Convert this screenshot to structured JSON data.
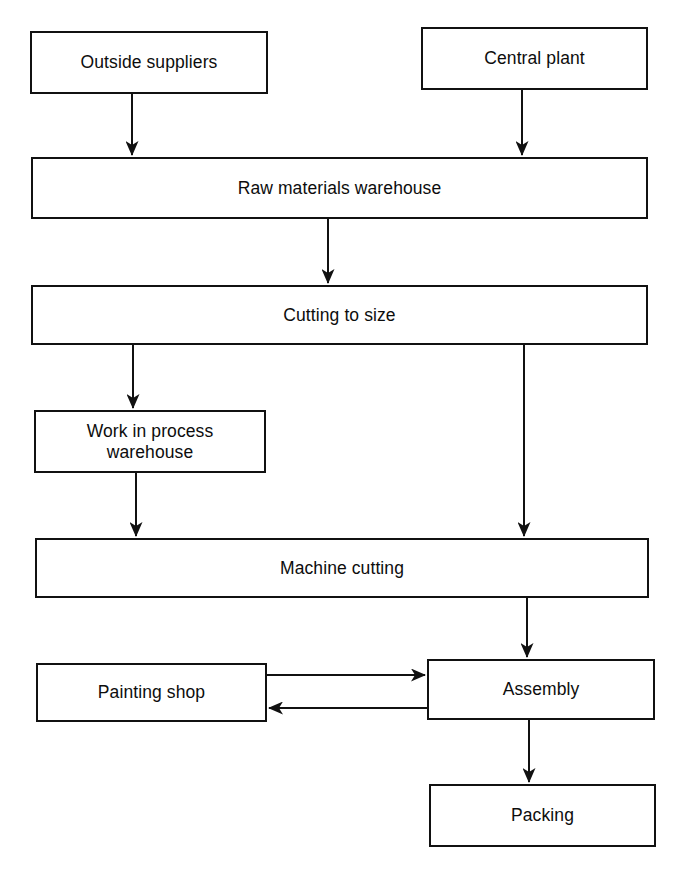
{
  "diagram": {
    "type": "flowchart",
    "orientation": "top-to-bottom",
    "background_color": "#ffffff",
    "line_color": "#111111",
    "text_color": "#0d0d0d",
    "nodes": [
      {
        "id": "outside-suppliers",
        "label": "Outside suppliers",
        "shape": "rectangle",
        "x": 30,
        "y": 31,
        "w": 238,
        "h": 63
      },
      {
        "id": "central-plant",
        "label": "Central plant",
        "shape": "rectangle",
        "x": 421,
        "y": 27,
        "w": 227,
        "h": 63
      },
      {
        "id": "raw-materials-warehouse",
        "label": "Raw materials warehouse",
        "shape": "rectangle",
        "x": 31,
        "y": 157,
        "w": 617,
        "h": 62
      },
      {
        "id": "cutting-to-size",
        "label": "Cutting to size",
        "shape": "rectangle",
        "x": 31,
        "y": 285,
        "w": 617,
        "h": 60
      },
      {
        "id": "work-in-process-warehouse",
        "label": "Work in process\nwarehouse",
        "shape": "rectangle",
        "x": 34,
        "y": 410,
        "w": 232,
        "h": 63
      },
      {
        "id": "machine-cutting",
        "label": "Machine cutting",
        "shape": "rectangle",
        "x": 35,
        "y": 538,
        "w": 614,
        "h": 60
      },
      {
        "id": "painting-shop",
        "label": "Painting shop",
        "shape": "rectangle",
        "x": 36,
        "y": 663,
        "w": 231,
        "h": 59
      },
      {
        "id": "assembly",
        "label": "Assembly",
        "shape": "rectangle",
        "x": 427,
        "y": 659,
        "w": 228,
        "h": 61
      },
      {
        "id": "packing",
        "label": "Packing",
        "shape": "rectangle",
        "x": 429,
        "y": 784,
        "w": 227,
        "h": 63
      }
    ],
    "edges": [
      {
        "id": "edge-outside-suppliers-to-raw-materials",
        "from": "outside-suppliers",
        "to": "raw-materials-warehouse",
        "direction": "down",
        "arrowhead": "end"
      },
      {
        "id": "edge-central-plant-to-raw-materials",
        "from": "central-plant",
        "to": "raw-materials-warehouse",
        "direction": "down",
        "arrowhead": "end"
      },
      {
        "id": "edge-raw-materials-to-cutting",
        "from": "raw-materials-warehouse",
        "to": "cutting-to-size",
        "direction": "down",
        "arrowhead": "end"
      },
      {
        "id": "edge-cutting-to-work-in-process",
        "from": "cutting-to-size",
        "to": "work-in-process-warehouse",
        "direction": "down",
        "arrowhead": "end"
      },
      {
        "id": "edge-cutting-to-machine-cutting",
        "from": "cutting-to-size",
        "to": "machine-cutting",
        "direction": "down",
        "arrowhead": "end"
      },
      {
        "id": "edge-work-in-process-to-machine-cutting",
        "from": "work-in-process-warehouse",
        "to": "machine-cutting",
        "direction": "down",
        "arrowhead": "end"
      },
      {
        "id": "edge-machine-cutting-to-assembly",
        "from": "machine-cutting",
        "to": "assembly",
        "direction": "down",
        "arrowhead": "end"
      },
      {
        "id": "edge-painting-shop-to-assembly",
        "from": "painting-shop",
        "to": "assembly",
        "direction": "right",
        "arrowhead": "end"
      },
      {
        "id": "edge-assembly-to-painting-shop",
        "from": "assembly",
        "to": "painting-shop",
        "direction": "left",
        "arrowhead": "end"
      },
      {
        "id": "edge-assembly-to-packing",
        "from": "assembly",
        "to": "packing",
        "direction": "down",
        "arrowhead": "end"
      }
    ]
  }
}
